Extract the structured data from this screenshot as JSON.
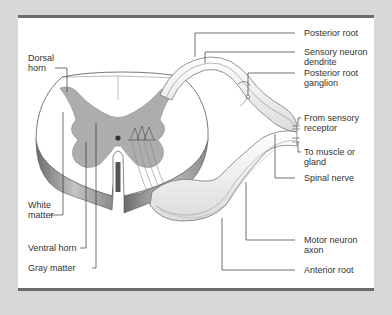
{
  "figure": {
    "colors": {
      "background": "#d8d8d8",
      "panel": "#ffffff",
      "frame_bar": "#6a6a6a",
      "gray_matter": "#a9a9a9",
      "white_matter": "#ffffff",
      "outline": "#555555"
    },
    "left_labels": {
      "dorsal_horn": "Dorsal\nhorn",
      "white_matter": "White\nmatter",
      "ventral_horn": "Ventral horn",
      "gray_matter": "Gray matter"
    },
    "right_labels": {
      "posterior_root": "Posterior root",
      "sensory_neuron_dendrite": "Sensory neuron\ndendrite",
      "posterior_root_ganglion": "Posterior root\nganglion",
      "from_sensory_receptor": "From sensory\nreceptor",
      "to_muscle_or_gland": "To muscle or\ngland",
      "spinal_nerve": "Spinal nerve",
      "motor_neuron_axon": "Motor neuron\naxon",
      "anterior_root": "Anterior root"
    }
  }
}
